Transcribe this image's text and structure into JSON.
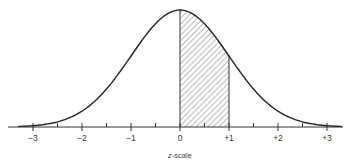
{
  "chart_data": {
    "type": "area",
    "title": "",
    "xlabel": "z-scale",
    "ylabel": "",
    "xlim": [
      -3.4,
      3.4
    ],
    "x_ticks_major": [
      -3,
      -2,
      -1,
      0,
      1,
      2,
      3
    ],
    "x_tick_labels": [
      "−3",
      "−2",
      "−1",
      "0",
      "+1",
      "+2",
      "+3"
    ],
    "x_ticks_minor": [
      -2.5,
      -1.5,
      -0.5,
      0.5,
      1.5,
      2.5
    ],
    "series": [
      {
        "name": "standard normal density",
        "x": [
          -3.0,
          -2.5,
          -2.0,
          -1.5,
          -1.0,
          -0.5,
          0.0,
          0.5,
          1.0,
          1.5,
          2.0,
          2.5,
          3.0
        ],
        "values": [
          0.0044,
          0.0175,
          0.054,
          0.1295,
          0.242,
          0.3521,
          0.3989,
          0.3521,
          0.242,
          0.1295,
          0.054,
          0.0175,
          0.0044
        ]
      }
    ],
    "shaded_region": {
      "from": 0,
      "to": 1,
      "pattern": "diagonal-hatch",
      "area": 0.3413
    },
    "grid": false,
    "legend": null
  },
  "colors": {
    "curve": "#222222",
    "axis": "#333333",
    "hatch": "#555555",
    "background": "#ffffff"
  }
}
